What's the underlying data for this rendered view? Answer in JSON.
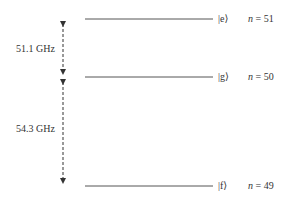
{
  "diagram": {
    "type": "energy-level-diagram",
    "levels": [
      {
        "ket": "|e⟩",
        "n_label": "n",
        "n_value": "= 51",
        "y": 19
      },
      {
        "ket": "|g⟩",
        "n_label": "n",
        "n_value": "= 50",
        "y": 77
      },
      {
        "ket": "|f⟩",
        "n_label": "n",
        "n_value": "= 49",
        "y": 186
      }
    ],
    "transitions": [
      {
        "label": "51.1 GHz",
        "from": "|e⟩",
        "to": "|g⟩"
      },
      {
        "label": "54.3 GHz",
        "from": "|g⟩",
        "to": "|f⟩"
      }
    ],
    "colors": {
      "line": "#555555",
      "text": "#333333"
    }
  }
}
